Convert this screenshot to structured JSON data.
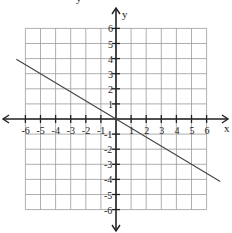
{
  "top_partial_text": "y",
  "chart_data": {
    "type": "line",
    "title": "",
    "xlabel": "x",
    "ylabel": "y",
    "xlim": [
      -6,
      6
    ],
    "ylim": [
      -6,
      6
    ],
    "grid": true,
    "x_ticks": [
      "-6",
      "-5",
      "-4",
      "-3",
      "-2",
      "-1",
      "1",
      "2",
      "3",
      "4",
      "5",
      "6"
    ],
    "y_ticks": [
      "6",
      "5",
      "4",
      "3",
      "2",
      "1",
      "-1",
      "-2",
      "-3",
      "-4",
      "-5",
      "-6"
    ],
    "series": [
      {
        "name": "y = -3/5 x",
        "slope": -0.6,
        "intercept": 0,
        "x": [
          -6.6,
          -5,
          0,
          5,
          6.9
        ],
        "y": [
          3.96,
          3,
          0,
          -3,
          -4.14
        ]
      }
    ],
    "colors": {
      "grid": "#9a9a9a",
      "axes": "#222222",
      "line": "#444444"
    }
  }
}
